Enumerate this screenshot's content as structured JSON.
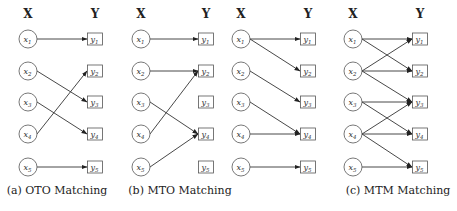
{
  "figure": {
    "left_header": "X",
    "right_header": "Y",
    "x_nodes": [
      "x1",
      "x2",
      "x3",
      "x4",
      "x5"
    ],
    "y_nodes": [
      "y1",
      "y2",
      "y3",
      "y4",
      "y5"
    ],
    "panels": [
      {
        "id": "oto",
        "caption": "(a) OTO Matching",
        "x_col": 28,
        "y_col": 95,
        "edges": [
          [
            1,
            1
          ],
          [
            2,
            3
          ],
          [
            3,
            4
          ],
          [
            4,
            2
          ],
          [
            5,
            5
          ]
        ]
      },
      {
        "id": "mto",
        "caption": "(b) MTO Matching",
        "x_col": 141,
        "y_col": 206,
        "edges": [
          [
            1,
            1
          ],
          [
            2,
            2
          ],
          [
            3,
            4
          ],
          [
            4,
            2
          ],
          [
            5,
            4
          ]
        ]
      },
      {
        "id": "otm",
        "caption": "",
        "x_col": 241,
        "y_col": 308,
        "edges": [
          [
            1,
            1
          ],
          [
            1,
            2
          ],
          [
            2,
            3
          ],
          [
            3,
            4
          ],
          [
            4,
            4
          ],
          [
            5,
            5
          ]
        ]
      },
      {
        "id": "mtm",
        "caption": "(c) MTM Matching",
        "x_col": 353,
        "y_col": 420,
        "edges": [
          [
            1,
            1
          ],
          [
            1,
            2
          ],
          [
            2,
            1
          ],
          [
            2,
            2
          ],
          [
            2,
            3
          ],
          [
            3,
            3
          ],
          [
            3,
            4
          ],
          [
            4,
            3
          ],
          [
            4,
            4
          ],
          [
            4,
            5
          ],
          [
            5,
            5
          ]
        ]
      }
    ],
    "row_y": [
      39,
      71,
      102,
      134,
      167
    ],
    "header_y": 18,
    "caption_y": 194,
    "caption_x": [
      57,
      180,
      null,
      398
    ]
  }
}
